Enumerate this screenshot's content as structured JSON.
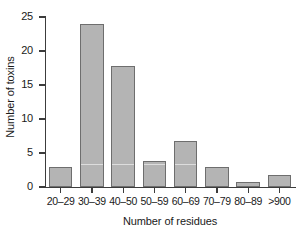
{
  "chart_data": {
    "type": "bar",
    "title": "",
    "xlabel": "Number of residues",
    "ylabel": "Number of toxins",
    "categories": [
      "20–29",
      "30–39",
      "40–50",
      "50–59",
      "60–69",
      "70–79",
      "80–89",
      ">900"
    ],
    "values": [
      3,
      24,
      17.8,
      3.8,
      6.7,
      2.9,
      0.8,
      1.8
    ],
    "ylim": [
      0,
      25
    ],
    "yticks": [
      0,
      5,
      10,
      15,
      20,
      25
    ],
    "ytick_labels": [
      "0",
      "5",
      "10",
      "15",
      "20",
      "25"
    ],
    "grid": false,
    "legend": false,
    "legend_position": "none",
    "bar_fill_color": "#b4b4b4",
    "bar_edge_color": "#6e6e6e",
    "axis_color": "#3c3c3c",
    "background_color": "#ffffff"
  }
}
